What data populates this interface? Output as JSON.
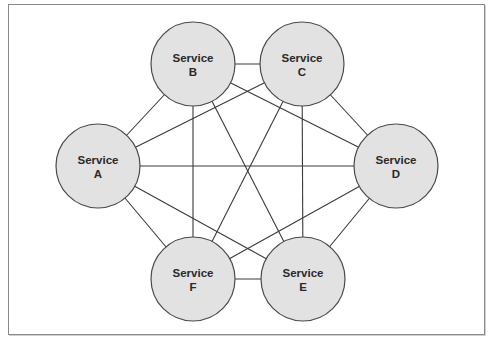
{
  "diagram": {
    "type": "network-mesh",
    "colors": {
      "node_fill": "#e2e2e2",
      "node_stroke": "#4a4a4a",
      "edge": "#3a3a3a",
      "frame": "#8a8a8a",
      "text": "#2a2a2a"
    },
    "nodes": [
      {
        "id": "A",
        "line1": "Service",
        "line2": "A",
        "cx": 98,
        "cy": 166,
        "r": 42
      },
      {
        "id": "B",
        "line1": "Service",
        "line2": "B",
        "cx": 193,
        "cy": 64,
        "r": 42
      },
      {
        "id": "C",
        "line1": "Service",
        "line2": "C",
        "cx": 302,
        "cy": 64,
        "r": 42
      },
      {
        "id": "D",
        "line1": "Service",
        "line2": "D",
        "cx": 396,
        "cy": 166,
        "r": 42
      },
      {
        "id": "E",
        "line1": "Service",
        "line2": "E",
        "cx": 303,
        "cy": 279,
        "r": 42
      },
      {
        "id": "F",
        "line1": "Service",
        "line2": "F",
        "cx": 193,
        "cy": 279,
        "r": 42
      }
    ],
    "edges": [
      [
        "A",
        "B"
      ],
      [
        "A",
        "C"
      ],
      [
        "A",
        "D"
      ],
      [
        "A",
        "E"
      ],
      [
        "A",
        "F"
      ],
      [
        "B",
        "C"
      ],
      [
        "B",
        "D"
      ],
      [
        "B",
        "E"
      ],
      [
        "B",
        "F"
      ],
      [
        "C",
        "D"
      ],
      [
        "C",
        "E"
      ],
      [
        "C",
        "F"
      ],
      [
        "D",
        "E"
      ],
      [
        "D",
        "F"
      ],
      [
        "E",
        "F"
      ]
    ]
  }
}
